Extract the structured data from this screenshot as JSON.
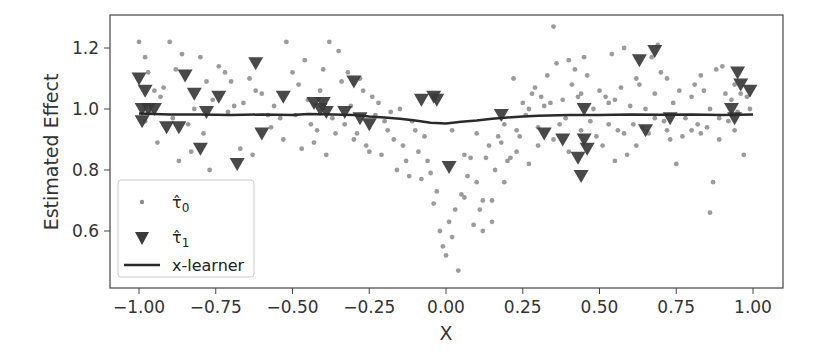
{
  "chart_data": {
    "type": "scatter",
    "title": "",
    "xlabel": "X",
    "ylabel": "Estimated Effect",
    "xlim": [
      -1.09,
      1.09
    ],
    "ylim": [
      0.42,
      1.31
    ],
    "grid": false,
    "legend_position": "lower left",
    "x_ticks": [
      -1.0,
      -0.75,
      -0.5,
      -0.25,
      0.0,
      0.25,
      0.5,
      0.75,
      1.0
    ],
    "x_tick_labels": [
      "−1.00",
      "−0.75",
      "−0.50",
      "−0.25",
      "0.00",
      "0.25",
      "0.50",
      "0.75",
      "1.00"
    ],
    "y_ticks": [
      0.6,
      0.8,
      1.0,
      1.2
    ],
    "y_tick_labels": [
      "0.6",
      "0.8",
      "1.0",
      "1.2"
    ],
    "series": [
      {
        "name": "tau_hat_0",
        "legend_label": "τ̂₀",
        "kind": "scatter",
        "marker": "circle",
        "color": "#8a8a8a",
        "points": [
          [
            -1.0,
            1.22
          ],
          [
            -0.98,
            1.17
          ],
          [
            -0.97,
            1.12
          ],
          [
            -0.95,
            1.06
          ],
          [
            -0.93,
            1.04
          ],
          [
            -0.96,
            0.99
          ],
          [
            -0.92,
            1.07
          ],
          [
            -0.9,
            1.22
          ],
          [
            -0.88,
            1.13
          ],
          [
            -0.86,
            1.18
          ],
          [
            -0.84,
            0.95
          ],
          [
            -0.82,
            1.0
          ],
          [
            -0.8,
            1.17
          ],
          [
            -0.78,
            1.09
          ],
          [
            -0.76,
            1.03
          ],
          [
            -0.74,
            1.14
          ],
          [
            -0.72,
            1.12
          ],
          [
            -0.7,
            1.09
          ],
          [
            -0.69,
            1.01
          ],
          [
            -0.66,
            1.02
          ],
          [
            -0.64,
            1.1
          ],
          [
            -0.62,
            1.06
          ],
          [
            -0.6,
            1.05
          ],
          [
            -0.58,
            0.98
          ],
          [
            -0.56,
            1.01
          ],
          [
            -0.54,
            0.97
          ],
          [
            -0.52,
            1.22
          ],
          [
            -0.5,
            1.12
          ],
          [
            -0.48,
            1.08
          ],
          [
            -0.46,
            1.16
          ],
          [
            -0.45,
            1.03
          ],
          [
            -0.44,
            0.95
          ],
          [
            -0.42,
            0.93
          ],
          [
            -0.41,
            1.06
          ],
          [
            -0.4,
            1.13
          ],
          [
            -0.38,
            1.22
          ],
          [
            -0.36,
            0.92
          ],
          [
            -0.35,
            1.19
          ],
          [
            -0.34,
            1.09
          ],
          [
            -0.33,
            0.95
          ],
          [
            -0.32,
            1.12
          ],
          [
            -0.31,
            1.01
          ],
          [
            -0.3,
            0.9
          ],
          [
            -0.28,
            1.1
          ],
          [
            -0.27,
            1.06
          ],
          [
            -0.26,
            0.88
          ],
          [
            -0.24,
            1.04
          ],
          [
            -0.22,
            1.02
          ],
          [
            -0.21,
            0.85
          ],
          [
            -0.2,
            0.96
          ],
          [
            -0.19,
            0.93
          ],
          [
            -0.17,
            0.9
          ],
          [
            -0.16,
            0.8
          ],
          [
            -0.15,
            1.0
          ],
          [
            -0.14,
            0.88
          ],
          [
            -0.13,
            0.83
          ],
          [
            -0.12,
            0.78
          ],
          [
            -0.1,
            0.93
          ],
          [
            -0.09,
            0.86
          ],
          [
            -0.08,
            0.77
          ],
          [
            -0.06,
            0.83
          ],
          [
            -0.05,
            0.79
          ],
          [
            -0.04,
            0.69
          ],
          [
            -0.03,
            0.73
          ],
          [
            -0.02,
            0.6
          ],
          [
            -0.01,
            0.55
          ],
          [
            0.0,
            0.52
          ],
          [
            0.01,
            0.63
          ],
          [
            0.02,
            0.58
          ],
          [
            0.03,
            0.67
          ],
          [
            0.04,
            0.47
          ],
          [
            0.05,
            0.72
          ],
          [
            0.06,
            0.71
          ],
          [
            0.07,
            0.78
          ],
          [
            0.08,
            0.84
          ],
          [
            0.09,
            0.62
          ],
          [
            0.1,
            0.76
          ],
          [
            0.11,
            0.67
          ],
          [
            0.12,
            0.6
          ],
          [
            0.13,
            0.84
          ],
          [
            0.14,
            0.88
          ],
          [
            0.15,
            0.7
          ],
          [
            0.16,
            0.8
          ],
          [
            0.17,
            0.91
          ],
          [
            0.18,
            0.89
          ],
          [
            0.19,
            0.95
          ],
          [
            0.2,
            0.83
          ],
          [
            0.21,
            0.84
          ],
          [
            0.22,
            1.1
          ],
          [
            0.23,
            0.93
          ],
          [
            0.24,
            0.91
          ],
          [
            0.25,
            1.02
          ],
          [
            0.26,
            0.98
          ],
          [
            0.27,
            1.0
          ],
          [
            0.28,
            1.05
          ],
          [
            0.29,
            1.07
          ],
          [
            0.3,
            0.94
          ],
          [
            0.31,
            1.04
          ],
          [
            0.32,
            1.01
          ],
          [
            0.33,
            1.11
          ],
          [
            0.34,
            1.02
          ],
          [
            0.35,
            1.27
          ],
          [
            0.36,
            1.15
          ],
          [
            0.37,
            0.95
          ],
          [
            0.38,
            1.03
          ],
          [
            0.39,
            0.97
          ],
          [
            0.4,
            1.16
          ],
          [
            0.41,
            1.08
          ],
          [
            0.42,
            1.13
          ],
          [
            0.43,
            1.04
          ],
          [
            0.44,
            1.05
          ],
          [
            0.45,
            1.17
          ],
          [
            0.46,
            1.11
          ],
          [
            0.47,
            0.96
          ],
          [
            0.48,
            1.0
          ],
          [
            0.5,
            1.06
          ],
          [
            0.51,
            0.88
          ],
          [
            0.52,
            1.04
          ],
          [
            0.53,
            1.02
          ],
          [
            0.54,
            1.18
          ],
          [
            0.55,
            1.03
          ],
          [
            0.56,
            0.93
          ],
          [
            0.57,
            1.07
          ],
          [
            0.58,
            1.2
          ],
          [
            0.59,
            0.85
          ],
          [
            0.6,
            1.01
          ],
          [
            0.61,
            0.95
          ],
          [
            0.62,
            1.1
          ],
          [
            0.63,
            1.08
          ],
          [
            0.64,
            0.94
          ],
          [
            0.65,
            1.0
          ],
          [
            0.66,
            0.92
          ],
          [
            0.67,
            1.17
          ],
          [
            0.68,
            1.05
          ],
          [
            0.69,
            1.21
          ],
          [
            0.7,
            1.12
          ],
          [
            0.71,
            0.96
          ],
          [
            0.72,
            1.1
          ],
          [
            0.73,
            0.9
          ],
          [
            0.74,
            1.02
          ],
          [
            0.75,
            0.82
          ],
          [
            0.76,
            1.06
          ],
          [
            0.78,
            0.97
          ],
          [
            0.8,
            1.04
          ],
          [
            0.81,
            1.08
          ],
          [
            0.82,
            0.95
          ],
          [
            0.83,
            1.11
          ],
          [
            0.84,
            1.06
          ],
          [
            0.85,
            0.94
          ],
          [
            0.86,
            1.0
          ],
          [
            0.87,
            0.76
          ],
          [
            0.88,
            1.13
          ],
          [
            0.89,
            0.97
          ],
          [
            0.9,
            1.14
          ],
          [
            0.91,
            1.05
          ],
          [
            0.92,
            0.96
          ],
          [
            0.93,
            1.03
          ],
          [
            0.94,
            1.08
          ],
          [
            0.95,
            0.99
          ],
          [
            0.96,
            1.05
          ],
          [
            0.97,
            0.85
          ],
          [
            0.98,
            1.04
          ],
          [
            0.99,
            1.0
          ],
          [
            0.86,
            0.66
          ],
          [
            0.8,
            0.93
          ],
          [
            0.62,
            0.88
          ],
          [
            0.55,
            0.83
          ],
          [
            -0.98,
            0.96
          ],
          [
            -0.94,
            0.89
          ],
          [
            -0.89,
            0.97
          ],
          [
            -0.87,
            0.83
          ],
          [
            -0.83,
            0.86
          ],
          [
            -0.79,
            0.92
          ],
          [
            -0.77,
            0.8
          ],
          [
            -0.71,
            0.99
          ],
          [
            -0.67,
            0.87
          ],
          [
            -0.63,
            0.85
          ],
          [
            -0.57,
            0.94
          ],
          [
            -0.53,
            0.9
          ],
          [
            -0.49,
            0.98
          ],
          [
            -0.47,
            0.87
          ],
          [
            -0.43,
            0.89
          ],
          [
            -0.39,
            0.85
          ],
          [
            -0.37,
            0.97
          ],
          [
            -0.29,
            0.92
          ],
          [
            -0.25,
            0.86
          ],
          [
            -0.23,
            0.98
          ],
          [
            -0.18,
            0.99
          ],
          [
            -0.11,
            0.96
          ],
          [
            -0.07,
            0.91
          ],
          [
            0.02,
            0.93
          ],
          [
            0.06,
            0.85
          ],
          [
            0.1,
            0.92
          ],
          [
            0.12,
            0.7
          ],
          [
            0.15,
            0.63
          ],
          [
            0.19,
            0.76
          ],
          [
            0.23,
            0.86
          ],
          [
            0.27,
            0.82
          ],
          [
            0.3,
            0.88
          ],
          [
            0.35,
            0.9
          ],
          [
            0.4,
            0.86
          ],
          [
            0.44,
            0.93
          ],
          [
            0.49,
            0.91
          ],
          [
            0.53,
            0.95
          ],
          [
            0.58,
            0.92
          ],
          [
            0.68,
            0.97
          ],
          [
            0.72,
            0.93
          ],
          [
            0.77,
            0.91
          ],
          [
            0.83,
            0.92
          ],
          [
            0.89,
            0.9
          ],
          [
            0.94,
            0.93
          ]
        ]
      },
      {
        "name": "tau_hat_1",
        "legend_label": "τ̂₁",
        "kind": "scatter",
        "marker": "triangle_down",
        "color": "#3a3a3a",
        "points": [
          [
            -1.0,
            1.1
          ],
          [
            -0.98,
            1.06
          ],
          [
            -0.99,
            1.0
          ],
          [
            -0.97,
            1.0
          ],
          [
            -0.99,
            0.96
          ],
          [
            -0.95,
            1.0
          ],
          [
            -0.91,
            0.94
          ],
          [
            -0.87,
            0.94
          ],
          [
            -0.85,
            1.11
          ],
          [
            -0.82,
            1.05
          ],
          [
            -0.8,
            0.87
          ],
          [
            -0.78,
            0.99
          ],
          [
            -0.74,
            1.04
          ],
          [
            -0.68,
            0.82
          ],
          [
            -0.62,
            1.15
          ],
          [
            -0.6,
            0.92
          ],
          [
            -0.53,
            1.04
          ],
          [
            -0.43,
            1.02
          ],
          [
            -0.41,
            1.0
          ],
          [
            -0.4,
            1.02
          ],
          [
            -0.39,
            0.99
          ],
          [
            -0.33,
            0.99
          ],
          [
            -0.3,
            1.09
          ],
          [
            -0.28,
            0.97
          ],
          [
            -0.25,
            0.95
          ],
          [
            -0.08,
            1.03
          ],
          [
            -0.04,
            1.04
          ],
          [
            -0.03,
            1.03
          ],
          [
            0.01,
            0.81
          ],
          [
            0.18,
            0.98
          ],
          [
            0.32,
            0.92
          ],
          [
            0.38,
            0.9
          ],
          [
            0.43,
            0.84
          ],
          [
            0.44,
            0.78
          ],
          [
            0.45,
            0.9
          ],
          [
            0.45,
            1.0
          ],
          [
            0.46,
            0.87
          ],
          [
            0.63,
            1.16
          ],
          [
            0.65,
            0.93
          ],
          [
            0.68,
            1.19
          ],
          [
            0.73,
            0.97
          ],
          [
            0.93,
            1.0
          ],
          [
            0.94,
            0.97
          ],
          [
            0.95,
            1.12
          ],
          [
            0.96,
            1.08
          ],
          [
            0.99,
            1.06
          ]
        ]
      },
      {
        "name": "x-learner",
        "legend_label": "x-learner",
        "kind": "line",
        "color": "#2a2a2a",
        "points": [
          [
            -1.0,
            0.985
          ],
          [
            -0.9,
            0.982
          ],
          [
            -0.8,
            0.982
          ],
          [
            -0.7,
            0.98
          ],
          [
            -0.6,
            0.982
          ],
          [
            -0.5,
            0.98
          ],
          [
            -0.45,
            0.984
          ],
          [
            -0.4,
            0.983
          ],
          [
            -0.3,
            0.98
          ],
          [
            -0.25,
            0.975
          ],
          [
            -0.2,
            0.972
          ],
          [
            -0.15,
            0.968
          ],
          [
            -0.1,
            0.962
          ],
          [
            -0.05,
            0.955
          ],
          [
            0.0,
            0.952
          ],
          [
            0.05,
            0.958
          ],
          [
            0.1,
            0.962
          ],
          [
            0.15,
            0.968
          ],
          [
            0.2,
            0.972
          ],
          [
            0.25,
            0.975
          ],
          [
            0.3,
            0.978
          ],
          [
            0.4,
            0.98
          ],
          [
            0.5,
            0.98
          ],
          [
            0.6,
            0.982
          ],
          [
            0.7,
            0.981
          ],
          [
            0.8,
            0.982
          ],
          [
            0.9,
            0.98
          ],
          [
            1.0,
            0.982
          ]
        ]
      }
    ]
  },
  "legend": {
    "items": [
      {
        "label_base": "τ̂",
        "label_sub": "0",
        "marker": "dot"
      },
      {
        "label_base": "τ̂",
        "label_sub": "1",
        "marker": "triangle"
      },
      {
        "label_base": "x-learner",
        "label_sub": "",
        "marker": "line"
      }
    ]
  },
  "colors": {
    "dot": "#8a8a8a",
    "triangle": "#3a3a3a",
    "line": "#2a2a2a",
    "axis": "#333333",
    "legend_border": "#cccccc"
  }
}
